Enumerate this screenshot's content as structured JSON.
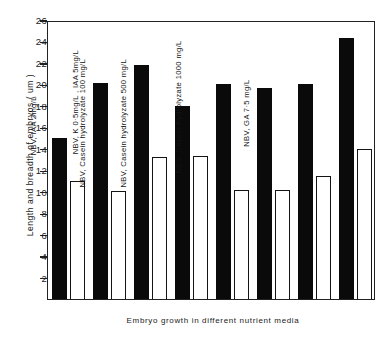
{
  "chart_data": {
    "type": "bar",
    "title": "",
    "xlabel": "Embryo growth in different nutrient media",
    "ylabel": "Length and breadth of embryos ( um )",
    "ylim": [
      0,
      26
    ],
    "yticks": [
      2,
      4,
      6,
      8,
      10,
      12,
      14,
      16,
      18,
      20,
      22,
      24,
      26
    ],
    "ytick_labels": [
      "2",
      "4",
      "6",
      "8",
      "10",
      "12",
      "14",
      "16",
      "18",
      "20",
      "22",
      "24",
      "26"
    ],
    "grid": false,
    "legend": "none",
    "categories": [
      "Control in field",
      "Nitsch's basic medium (NBV)",
      "NBV, IAA 2mg/L",
      "NBV, K 0·5mg/L , IAA 5mg/L",
      "NBV, Casein hydrolyzate 100 mg/L",
      "NBV, Casein hydrolyzate 500 mg/L",
      "NBV, Casein hydrolyzate 1000 mg/L",
      "NBV, GA 7·5 mg/L"
    ],
    "series": [
      {
        "name": "Length",
        "fill": "#0a0a0a",
        "values": [
          15.0,
          20.1,
          21.8,
          18.0,
          20.0,
          19.7,
          20.0,
          24.3
        ]
      },
      {
        "name": "Breadth",
        "fill": "#ffffff",
        "values": [
          11.0,
          10.1,
          13.2,
          13.3,
          10.2,
          10.2,
          11.5,
          14.0
        ]
      }
    ]
  },
  "axes": {
    "y_title": "Length and breadth of embryos ( um )",
    "x_title": "Embryo growth in different nutrient media"
  }
}
